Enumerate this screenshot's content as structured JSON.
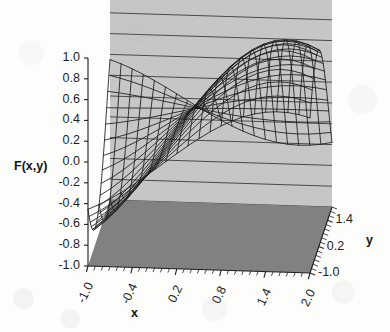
{
  "chart_data": {
    "type": "line",
    "subtype": "3d-wireframe-surface",
    "title": "F(x,y) = sin(x) cos(y)",
    "function": "sin(x)*cos(y)",
    "xlabel": "x",
    "ylabel": "y",
    "zlabel": "F(x,y)",
    "grid": true,
    "legend": null,
    "xlim": [
      -1.0,
      2.0
    ],
    "ylim": [
      -1.0,
      2.0
    ],
    "zlim": [
      -1.0,
      1.0
    ],
    "x_ticks": [
      "-1.0",
      "-0.4",
      "0.2",
      "0.8",
      "1.4",
      "2.0"
    ],
    "x_tick_values": [
      -1.0,
      -0.4,
      0.2,
      0.8,
      1.4,
      2.0
    ],
    "y_ticks": [
      "-1.0",
      "0.2",
      "1.4"
    ],
    "y_tick_values": [
      -1.0,
      0.2,
      1.4
    ],
    "z_ticks": [
      "1.0",
      "0.8",
      "0.6",
      "0.4",
      "0.2",
      "0.0",
      "-0.2",
      "-0.4",
      "-0.6",
      "-0.8",
      "-1.0"
    ],
    "z_tick_values": [
      1.0,
      0.8,
      0.6,
      0.4,
      0.2,
      0.0,
      -0.2,
      -0.4,
      -0.6,
      -0.8,
      -1.0
    ],
    "mesh_step": 0.15,
    "surface_samples": [
      {
        "x": -1.0,
        "y": -1.0,
        "z": -0.455
      },
      {
        "x": -1.0,
        "y": 0.2,
        "z": -0.824
      },
      {
        "x": -1.0,
        "y": 1.4,
        "z": -0.143
      },
      {
        "x": -1.0,
        "y": 2.0,
        "z": 0.35
      },
      {
        "x": -0.4,
        "y": -1.0,
        "z": -0.21
      },
      {
        "x": -0.4,
        "y": 0.2,
        "z": -0.382
      },
      {
        "x": -0.4,
        "y": 1.4,
        "z": -0.066
      },
      {
        "x": -0.4,
        "y": 2.0,
        "z": 0.162
      },
      {
        "x": 0.2,
        "y": -1.0,
        "z": 0.107
      },
      {
        "x": 0.2,
        "y": 0.2,
        "z": 0.195
      },
      {
        "x": 0.2,
        "y": 1.4,
        "z": 0.034
      },
      {
        "x": 0.2,
        "y": 2.0,
        "z": -0.083
      },
      {
        "x": 0.8,
        "y": -1.0,
        "z": 0.388
      },
      {
        "x": 0.8,
        "y": 0.2,
        "z": 0.703
      },
      {
        "x": 0.8,
        "y": 1.4,
        "z": 0.122
      },
      {
        "x": 0.8,
        "y": 2.0,
        "z": -0.299
      },
      {
        "x": 1.4,
        "y": -1.0,
        "z": 0.532
      },
      {
        "x": 1.4,
        "y": 0.2,
        "z": 0.966
      },
      {
        "x": 1.4,
        "y": 1.4,
        "z": 0.167
      },
      {
        "x": 1.4,
        "y": 2.0,
        "z": -0.41
      },
      {
        "x": 2.0,
        "y": -1.0,
        "z": 0.491
      },
      {
        "x": 2.0,
        "y": 0.2,
        "z": 0.891
      },
      {
        "x": 2.0,
        "y": 1.4,
        "z": 0.155
      },
      {
        "x": 2.0,
        "y": 2.0,
        "z": -0.378
      }
    ],
    "peak": {
      "x": 1.57,
      "y": 0.0,
      "z": 1.0
    },
    "trough": {
      "x": -1.0,
      "y": 0.0,
      "z": -0.841
    }
  },
  "axes": {
    "z_label": "F(x,y)",
    "x_label": "x",
    "y_label": "y",
    "z_tick_labels": [
      "1.0",
      "0.8",
      "0.6",
      "0.4",
      "0.2",
      "0.0",
      "-0.2",
      "-0.4",
      "-0.6",
      "-0.8",
      "-1.0"
    ],
    "x_tick_labels": [
      "-1.0",
      "-0.4",
      "0.2",
      "0.8",
      "1.4",
      "2.0"
    ],
    "y_tick_labels": [
      "1.4",
      "0.2",
      "-1.0"
    ]
  },
  "style": {
    "wall_color": "#c6c6c6",
    "floor_color": "#818181",
    "gridline_color": "#3c3c3c",
    "mesh_color": "#1a1a1a",
    "text_color": "#1d1d1d",
    "page_background": "#fdfdfc"
  }
}
